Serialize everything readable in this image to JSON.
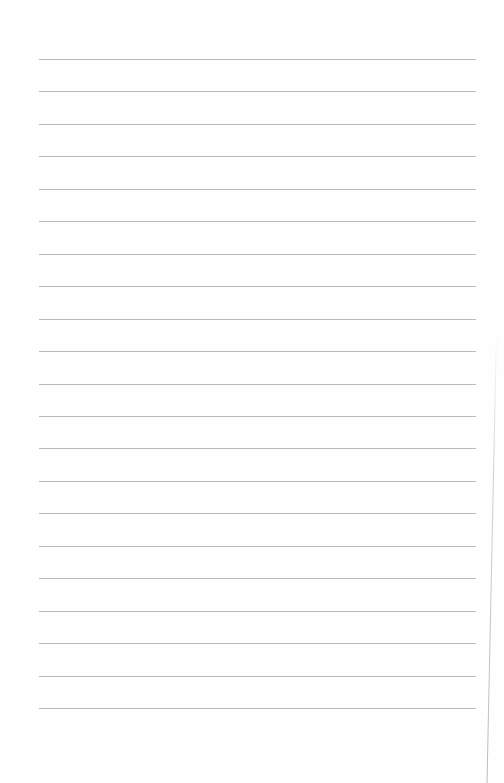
{
  "document": {
    "type": "lined-paper",
    "background_color": "#fefefe",
    "rule_color": "#b4b4b4",
    "rule_count": 21,
    "first_rule_y": 59,
    "rule_spacing": 32.45,
    "rule_left": 39,
    "rule_width": 437,
    "text_content": []
  }
}
